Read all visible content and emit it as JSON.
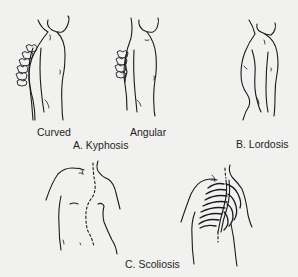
{
  "figure": {
    "background_color": "#f1f1f0",
    "line_color": "#1a1a1a",
    "panels": [
      {
        "id": "A",
        "label": "A. Kyphosis",
        "subfigures": [
          {
            "label": "Curved",
            "icon": "kyphosis-curved-figure"
          },
          {
            "label": "Angular",
            "icon": "kyphosis-angular-figure"
          }
        ]
      },
      {
        "id": "B",
        "label": "B. Lordosis",
        "subfigures": [
          {
            "label": "",
            "icon": "lordosis-figure"
          }
        ]
      },
      {
        "id": "C",
        "label": "C. Scoliosis",
        "subfigures": [
          {
            "label": "",
            "icon": "scoliosis-back-dotted-spine-figure"
          },
          {
            "label": "",
            "icon": "scoliosis-rib-cage-figure"
          }
        ]
      }
    ]
  }
}
